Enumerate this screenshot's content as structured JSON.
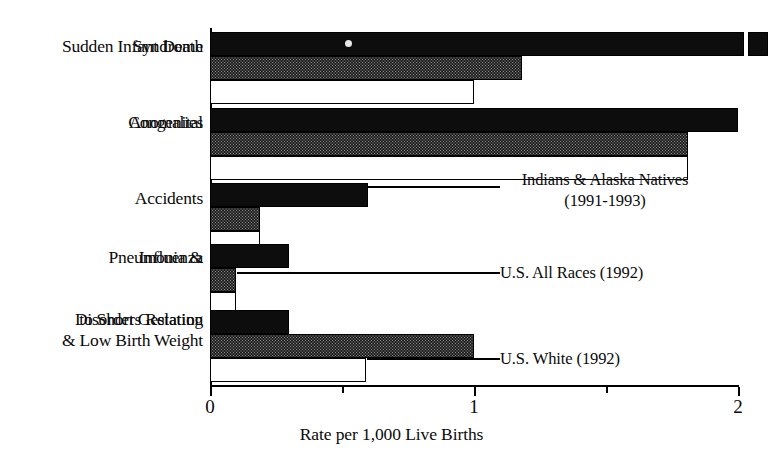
{
  "chart_data": {
    "type": "bar",
    "orientation": "horizontal",
    "title": "",
    "xlabel": "Rate per 1,000 Live Births",
    "ylabel": "",
    "xlim": [
      0,
      2
    ],
    "xticks": [
      0,
      1,
      2
    ],
    "xtick_labels": [
      "0",
      "1",
      "2"
    ],
    "xminor_ticks": [
      0.5,
      1.5
    ],
    "grid": false,
    "legend_position": "inline-callouts",
    "categories": [
      "Sudden Infant Death Syndrome",
      "Congenital Anomalies",
      "Accidents",
      "Pneumonia & Influenza",
      "Disorders Relating to Short Gestation & Low Birth Weight"
    ],
    "category_label_lines": [
      [
        "Sudden Infant Death",
        "Syndrome"
      ],
      [
        "Congenital",
        "Anomalies"
      ],
      [
        "Accidents"
      ],
      [
        "Pneumonia &",
        "Influenza"
      ],
      [
        "Disorders Relating",
        "to Short Gestation",
        "& Low Birth Weight"
      ]
    ],
    "series": [
      {
        "name": "Indians & Alaska Natives (1991-1993)",
        "label_line1": "Indians & Alaska Natives",
        "label_line2": "(1991-1993)",
        "fill": "black",
        "values": [
          2.12,
          2.0,
          0.6,
          0.3,
          0.3
        ]
      },
      {
        "name": "U.S. All Races (1992)",
        "label_line1": "U.S. All Races (1992)",
        "label_line2": "",
        "fill": "gray-hatch",
        "values": [
          1.18,
          1.81,
          0.19,
          0.1,
          1.0
        ]
      },
      {
        "name": "U.S. White (1992)",
        "label_line1": "U.S. White (1992)",
        "label_line2": "",
        "fill": "white",
        "values": [
          1.0,
          1.81,
          0.19,
          0.1,
          0.59
        ]
      }
    ]
  },
  "axis": {
    "tick_0": "0",
    "tick_1": "1",
    "tick_2": "2",
    "x_title": "Rate per 1,000 Live Births"
  },
  "labels": {
    "sids_line1": "Sudden Infant Death",
    "sids_line2": "Syndrome",
    "congenital_line1": "Congenital",
    "congenital_line2": "Anomalies",
    "accidents_line1": "Accidents",
    "pneumonia_line1": "Pneumonia &",
    "pneumonia_line2": "Influenza",
    "disorders_line1": "Disorders Relating",
    "disorders_line2": "to Short Gestation",
    "disorders_line3": "& Low Birth Weight"
  },
  "callouts": {
    "indians_line1": "Indians & Alaska Natives",
    "indians_line2": "(1991-1993)",
    "all_races": "U.S. All Races (1992)",
    "white": "U.S. White (1992)"
  },
  "colors": {
    "ink": "#000000",
    "black_bar": "#0d0d0d",
    "gray_bar": "#8d8d8d",
    "white_bar": "#ffffff",
    "background": "#ffffff"
  }
}
